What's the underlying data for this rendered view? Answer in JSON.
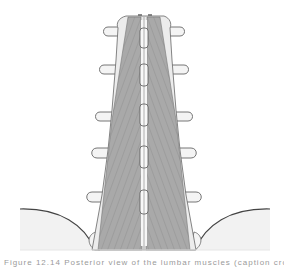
{
  "figure": {
    "colors": {
      "background": "#ffffff",
      "bone_fill": "#f4f4f4",
      "bone_stroke": "#6a6a6a",
      "muscle_fill": "#a8a8a8",
      "muscle_fiber": "#8a8a8a",
      "pelvis_fill": "#f2f2f2",
      "spinous_fill": "#f8f8f8"
    },
    "vertebrae_count": 5,
    "transverse_process_y": [
      31,
      68,
      115,
      152,
      194
    ],
    "spinous_process_y": [
      32,
      70,
      112,
      152,
      196
    ]
  },
  "caption": {
    "text": "Figure 12.14  Posterior view of the lumbar muscles (caption cropped)"
  }
}
